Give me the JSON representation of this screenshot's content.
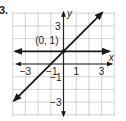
{
  "problem": {
    "number": "3."
  },
  "chart_data": {
    "type": "line",
    "title": "",
    "xlabel": "x",
    "ylabel": "y",
    "xlim": [
      -4,
      4
    ],
    "ylim": [
      -4,
      4
    ],
    "grid": true,
    "x_tick_labels": [
      "-3",
      "-1",
      "1",
      "3"
    ],
    "y_tick_labels": [
      "3",
      "-1",
      "-3"
    ],
    "annotations": [
      {
        "text": "(0, 1)",
        "x": 0,
        "y": 1
      }
    ],
    "series": [
      {
        "name": "y = x + 1",
        "kind": "line",
        "slope": 1,
        "intercept": 1,
        "arrows": "both"
      },
      {
        "name": "y = 1",
        "kind": "line",
        "slope": 0,
        "intercept": 1,
        "arrows": "both"
      }
    ]
  },
  "style": {
    "grid_color": "#c8c8c8",
    "axis_color": "#222222",
    "line_color": "#1a1a1a"
  }
}
